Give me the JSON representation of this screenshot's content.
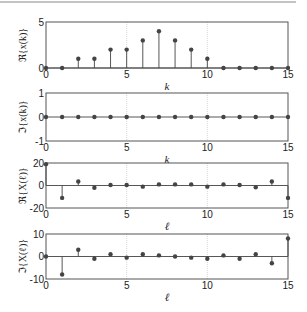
{
  "chart_data": [
    {
      "type": "stem",
      "ylabel": "ℜ{x(k)}",
      "xlabel": "k",
      "xlim": [
        0,
        15
      ],
      "ylim": [
        0,
        5
      ],
      "xticks": [
        0,
        5,
        10,
        15
      ],
      "yticks": [
        0,
        5
      ],
      "grid": "vertical",
      "x": [
        0,
        1,
        2,
        3,
        4,
        5,
        6,
        7,
        8,
        9,
        10,
        11,
        12,
        13,
        14,
        15
      ],
      "values": [
        0,
        0,
        1,
        1,
        2,
        2,
        3,
        4,
        3,
        2,
        1,
        0,
        0,
        0,
        0,
        0
      ]
    },
    {
      "type": "stem",
      "ylabel": "ℑ{x(k)}",
      "xlabel": "k",
      "xlim": [
        0,
        15
      ],
      "ylim": [
        -1,
        1
      ],
      "xticks": [
        0,
        5,
        10,
        15
      ],
      "yticks": [
        -1,
        0,
        1
      ],
      "grid": "vertical",
      "x": [
        0,
        1,
        2,
        3,
        4,
        5,
        6,
        7,
        8,
        9,
        10,
        11,
        12,
        13,
        14,
        15
      ],
      "values": [
        0,
        0,
        0,
        0,
        0,
        0,
        0,
        0,
        0,
        0,
        0,
        0,
        0,
        0,
        0,
        0
      ]
    },
    {
      "type": "stem",
      "ylabel": "ℜ{X(ℓ)}",
      "xlabel": "ℓ",
      "xlim": [
        0,
        15
      ],
      "ylim": [
        -20,
        20
      ],
      "xticks": [
        0,
        5,
        10,
        15
      ],
      "yticks": [
        -20,
        0,
        20
      ],
      "grid": "vertical",
      "x": [
        0,
        1,
        2,
        3,
        4,
        5,
        6,
        7,
        8,
        9,
        10,
        11,
        12,
        13,
        14,
        15
      ],
      "values": [
        19,
        -11,
        3.5,
        -2,
        0.5,
        0.5,
        -1,
        1,
        1,
        1,
        -1,
        1,
        0.5,
        -1.5,
        3.5,
        -11
      ]
    },
    {
      "type": "stem",
      "ylabel": "ℑ{X(ℓ)}",
      "xlabel": "ℓ",
      "xlim": [
        0,
        15
      ],
      "ylim": [
        -10,
        10
      ],
      "xticks": [
        0,
        5,
        10,
        15
      ],
      "yticks": [
        -10,
        0,
        10
      ],
      "grid": "vertical",
      "x": [
        0,
        1,
        2,
        3,
        4,
        5,
        6,
        7,
        8,
        9,
        10,
        11,
        12,
        13,
        14,
        15
      ],
      "values": [
        0,
        -8,
        3,
        -1,
        1,
        -0.5,
        1,
        0.5,
        0,
        -0.5,
        -1,
        0.5,
        -1,
        1,
        -3,
        8
      ]
    }
  ],
  "layout": {
    "axes_left": 46,
    "axes_right": 288,
    "panels": [
      {
        "top": 22,
        "bottom": 68
      },
      {
        "top": 93,
        "bottom": 141
      },
      {
        "top": 163,
        "bottom": 208
      },
      {
        "top": 234,
        "bottom": 279
      }
    ],
    "colors": {
      "axis": "#555555",
      "stem": "#444444",
      "marker": "#444444",
      "grid": "#cccccc",
      "topline": "#888888"
    }
  }
}
